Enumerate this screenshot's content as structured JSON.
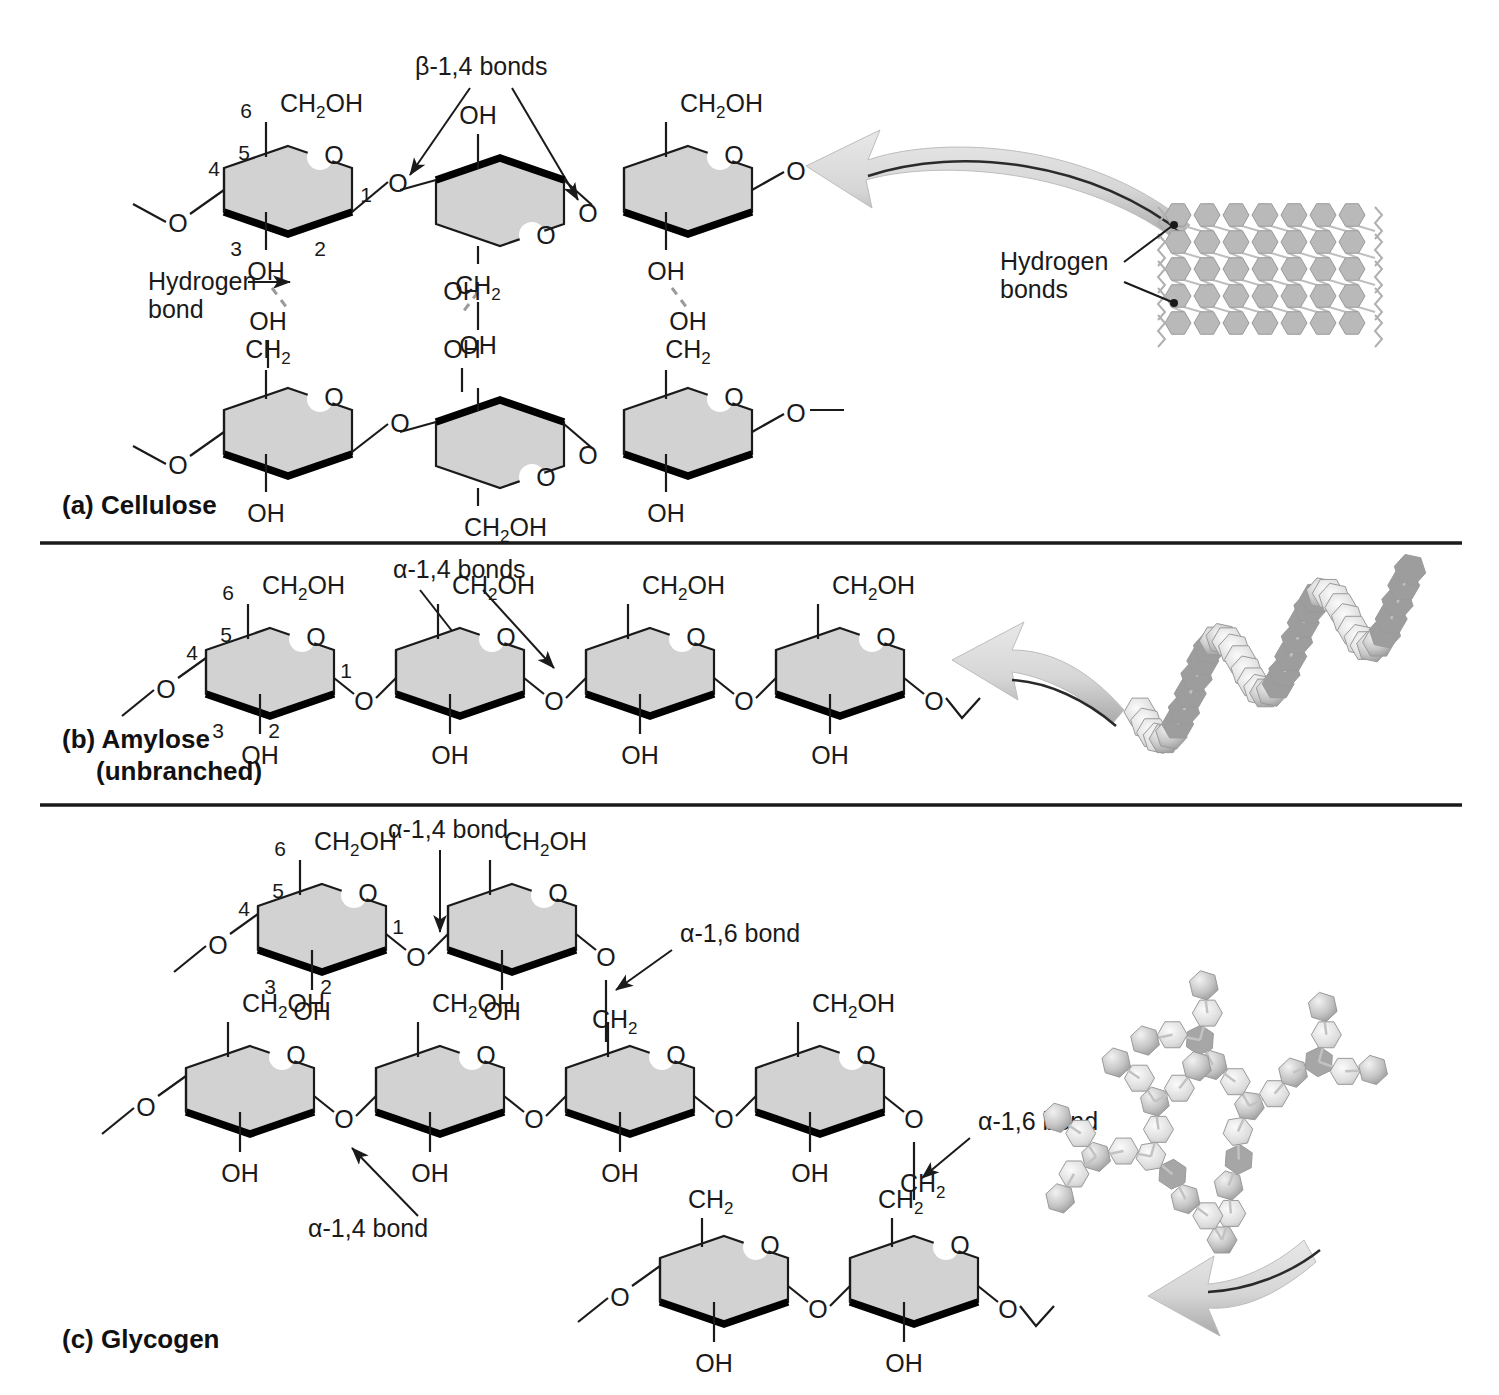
{
  "figure": {
    "ring_fill": "#d2d2d2",
    "ring_stroke": "#1a1a1a",
    "arrow_fill": "#d8d8d8",
    "model_fill": "#b3b3b3"
  },
  "panels": [
    {
      "id": "a",
      "label": "(a) Cellulose",
      "sublabel": "",
      "bond_label": "β-1,4 bonds",
      "callout": "Hydrogen\nbond",
      "callout_line1": "Hydrogen",
      "callout_line2": "bond",
      "model_callout_line1": "Hydrogen",
      "model_callout_line2": "bonds",
      "model_type": "microfibril-sheet",
      "model_rows": 5,
      "model_cols": 7,
      "ring_numbers": [
        "6",
        "5",
        "4",
        "3",
        "2",
        "1"
      ],
      "top_chain": [
        {
          "orientation": "up",
          "c6": "CH2OH",
          "c2_oh": "OH",
          "numbered": true
        },
        {
          "orientation": "down",
          "c6": "CH2",
          "c6_oh": "OH",
          "top_oh": "OH",
          "numbered": false
        },
        {
          "orientation": "up",
          "c6": "CH2OH",
          "c2_oh": "OH",
          "numbered": false
        }
      ],
      "bottom_chain": [
        {
          "orientation": "up",
          "c6": "CH2",
          "c6_oh": "OH",
          "c2_oh": "OH",
          "numbered": false
        },
        {
          "orientation": "down",
          "c6": "CH2OH",
          "top_oh": "OH",
          "numbered": false
        },
        {
          "orientation": "up",
          "c6": "CH2",
          "c6_oh": "OH",
          "c2_oh": "OH",
          "numbered": false
        }
      ]
    },
    {
      "id": "b",
      "label": "(b) Amylose",
      "sublabel": "(unbranched)",
      "bond_label": "α-1,4 bonds",
      "model_type": "helix",
      "ring_numbers": [
        "6",
        "5",
        "4",
        "3",
        "2",
        "1"
      ],
      "chain": [
        {
          "orientation": "up",
          "c6": "CH2OH",
          "c2_oh": "OH",
          "numbered": true
        },
        {
          "orientation": "up",
          "c6": "CH2OH",
          "c2_oh": "OH",
          "numbered": false
        },
        {
          "orientation": "up",
          "c6": "CH2OH",
          "c2_oh": "OH",
          "numbered": false
        },
        {
          "orientation": "up",
          "c6": "CH2OH",
          "c2_oh": "OH",
          "numbered": false
        }
      ]
    },
    {
      "id": "c",
      "label": "(c) Glycogen",
      "sublabel": "",
      "bond_label_14_top": "α-1,4 bond",
      "bond_label_16_top": "α-1,6 bond",
      "bond_label_14_mid": "α-1,4 bond",
      "bond_label_16_mid": "α-1,6 bond",
      "model_type": "branched",
      "ring_numbers": [
        "6",
        "5",
        "4",
        "3",
        "2",
        "1"
      ],
      "top_chain": [
        {
          "orientation": "up",
          "c6": "CH2OH",
          "c2_oh": "OH",
          "numbered": true
        },
        {
          "orientation": "up",
          "c6": "CH2OH",
          "c2_oh": "OH",
          "numbered": false
        }
      ],
      "middle_chain": [
        {
          "orientation": "up",
          "c6": "CH2OH",
          "c2_oh": "OH",
          "numbered": false
        },
        {
          "orientation": "up",
          "c6": "CH2OH",
          "c2_oh": "OH",
          "numbered": false
        },
        {
          "orientation": "up",
          "c6": "CH2",
          "c2_oh": "OH",
          "numbered": false
        },
        {
          "orientation": "up",
          "c6": "CH2OH",
          "c2_oh": "OH",
          "numbered": false
        }
      ],
      "bottom_chain": [
        {
          "orientation": "up",
          "c6": "CH2",
          "c2_oh": "OH",
          "numbered": false
        },
        {
          "orientation": "up",
          "c6": "CH2",
          "c2_oh": "OH",
          "numbered": false
        }
      ]
    }
  ],
  "atoms": {
    "oxygen": "O",
    "hydroxyl": "OH",
    "ch2oh": "CH2OH",
    "ch2": "CH2",
    "sub2": "2"
  }
}
